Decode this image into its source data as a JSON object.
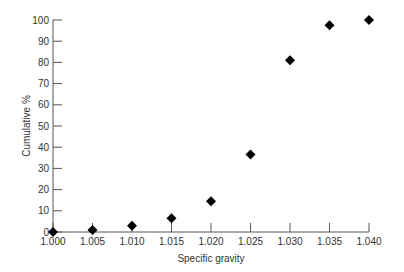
{
  "chart_data": {
    "type": "scatter",
    "title": "",
    "xlabel": "Specific gravity",
    "ylabel": "Cumulative %",
    "x": [
      1.0,
      1.005,
      1.01,
      1.015,
      1.02,
      1.025,
      1.03,
      1.035,
      1.04
    ],
    "series": [
      {
        "name": "Cumulative %",
        "marker": "diamond",
        "color": "#000000",
        "values": [
          0,
          1,
          3,
          6.5,
          14.5,
          36.5,
          81,
          97.5,
          100
        ]
      }
    ],
    "xlim": [
      1.0,
      1.04
    ],
    "ylim": [
      0,
      100
    ],
    "x_ticks": [
      "1.000",
      "1.005",
      "1.010",
      "1.015",
      "1.020",
      "1.025",
      "1.030",
      "1.035",
      "1.040"
    ],
    "y_ticks": [
      "0",
      "10",
      "20",
      "30",
      "40",
      "50",
      "60",
      "70",
      "80",
      "90",
      "100"
    ],
    "grid": false,
    "legend": "none"
  }
}
